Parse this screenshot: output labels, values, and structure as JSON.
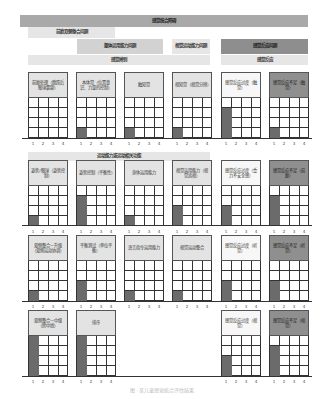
{
  "banners": {
    "top": "感觉统合障碍",
    "vestibular_bilateral": "前庭双侧整合问题",
    "somatopraxis": "躯体运用能力问题",
    "visuomotor": "视觉运动能力问题",
    "sensory_modulation": "感觉反应问题",
    "sensory_discrimination": "感觉辨别",
    "sensory_reactivity": "感觉反应",
    "motor_related": "运动能力或运动相关功能"
  },
  "ticks": [
    "1",
    "2",
    "3",
    "4"
  ],
  "chart_data": {
    "type": "bar",
    "title": "感觉统合障碍",
    "ylim": [
      0,
      4
    ],
    "xlabel": "",
    "ylabel": "",
    "categories_x": [
      "1",
      "2",
      "3",
      "4"
    ],
    "panels": [
      {
        "row": 1,
        "label": "前庭处理（跳跃后眼球震颤）",
        "values": [
          0,
          0,
          0,
          0
        ]
      },
      {
        "row": 1,
        "label": "本体觉（位置意识、力量的控制）",
        "values": [
          1,
          0,
          0,
          0
        ]
      },
      {
        "row": 1,
        "label": "触知觉",
        "values": [
          1,
          0,
          0,
          0
        ]
      },
      {
        "row": 1,
        "label": "视知觉（视觉分辨）",
        "values": [
          1,
          0,
          0,
          0
        ]
      },
      {
        "row": 1,
        "label": "感觉反应过度（触觉）",
        "values": [
          3,
          0,
          0,
          0
        ]
      },
      {
        "row": 1,
        "label": "感觉反应不足（触觉）",
        "values": [
          1,
          0,
          0,
          0
        ]
      },
      {
        "row": 2,
        "label": "姿势/眼球（姿势控制）",
        "values": [
          1,
          0,
          0,
          0
        ]
      },
      {
        "row": 2,
        "label": "姿势控制（平衡性）",
        "values": [
          3,
          0,
          0,
          0
        ]
      },
      {
        "row": 2,
        "label": "身体运用能力",
        "values": [
          1,
          0,
          0,
          0
        ]
      },
      {
        "row": 2,
        "label": "视觉运用能力（视觉追视）",
        "values": [
          2,
          0,
          0,
          0
        ]
      },
      {
        "row": 2,
        "label": "感觉反应过度（重力不安全感）",
        "values": [
          2,
          0,
          0,
          0
        ]
      },
      {
        "row": 2,
        "label": "感觉反应不足（前庭）",
        "values": [
          3,
          0,
          0,
          0
        ]
      },
      {
        "row": 3,
        "label": "双侧整合—升级（双侧运动协调）",
        "values": [
          1,
          0,
          0,
          0
        ]
      },
      {
        "row": 3,
        "label": "平衡测试（单位平衡）",
        "values": [
          2,
          0,
          0,
          0
        ]
      },
      {
        "row": 3,
        "label": "语言指令运用能力",
        "values": [
          1,
          0,
          0,
          0
        ]
      },
      {
        "row": 3,
        "label": "视觉运动整合",
        "values": [
          1,
          0,
          0,
          0
        ]
      },
      {
        "row": 3,
        "label": "感觉反应过度（听觉）",
        "values": [
          2,
          0,
          0,
          0
        ]
      },
      {
        "row": 3,
        "label": "感觉反应不足（听觉）",
        "values": [
          2,
          0,
          0,
          0
        ]
      },
      {
        "row": 4,
        "label": "双侧整合—中级（跨中线）",
        "values": [
          4,
          0,
          0,
          0
        ]
      },
      {
        "row": 4,
        "label": "排序",
        "values": [
          4,
          0,
          0,
          0
        ]
      },
      {
        "row": 4,
        "label": "感觉反应过度（视觉）",
        "values": [
          2,
          0,
          0,
          0
        ]
      },
      {
        "row": 4,
        "label": "感觉反应不足（视觉）",
        "values": [
          3,
          0,
          0,
          0
        ]
      }
    ]
  },
  "cards": [
    {
      "label": "前庭处理（跳跃后眼球震颤）",
      "value": 0
    },
    {
      "label": "本体觉（位置意识、力量的控制）",
      "value": 1
    },
    {
      "label": "触知觉",
      "value": 1
    },
    {
      "label": "视知觉（视觉分辨）",
      "value": 1
    },
    {
      "label": "感觉反应过度（触觉）",
      "value": 3
    },
    {
      "label": "感觉反应不足（触觉）",
      "value": 1
    },
    {
      "label": "姿势/眼球（姿势控制）",
      "value": 1
    },
    {
      "label": "姿势控制（平衡性）",
      "value": 3
    },
    {
      "label": "身体运用能力",
      "value": 1
    },
    {
      "label": "视觉运用能力（视觉追视）",
      "value": 2
    },
    {
      "label": "感觉反应过度（重力不安全感）",
      "value": 2
    },
    {
      "label": "感觉反应不足（前庭）",
      "value": 3
    },
    {
      "label": "双侧整合—升级（双侧运动协调）",
      "value": 1
    },
    {
      "label": "平衡测试（单位平衡）",
      "value": 2
    },
    {
      "label": "语言指令运用能力",
      "value": 1
    },
    {
      "label": "视觉运动整合",
      "value": 1
    },
    {
      "label": "感觉反应过度（听觉）",
      "value": 2
    },
    {
      "label": "感觉反应不足（听觉）",
      "value": 2
    },
    {
      "label": "双侧整合—中级（跨中线）",
      "value": 4
    },
    {
      "label": "排序",
      "value": 4
    },
    {
      "label": "感觉反应过度（视觉）",
      "value": 2
    },
    {
      "label": "感觉反应不足（视觉）",
      "value": 3
    }
  ],
  "caption": "图 · 某儿童感觉统合评估结果"
}
